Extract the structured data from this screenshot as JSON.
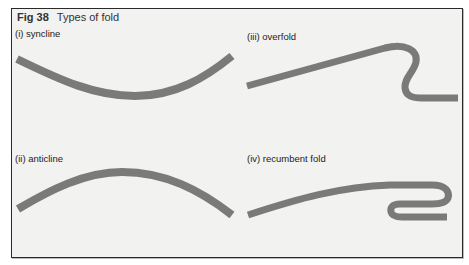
{
  "figure": {
    "number": "Fig 38",
    "title": "Types of fold",
    "stroke_color": "#7a7a7a",
    "background_color": "#f2f2f0",
    "panels": [
      {
        "id": "i",
        "label": "(i) syncline",
        "shape": "U-shaped downward curve"
      },
      {
        "id": "ii",
        "label": "(ii) anticline",
        "shape": "arch-shaped upward curve"
      },
      {
        "id": "iii",
        "label": "(iii) overfold",
        "shape": "rising limb folded over into S-bend"
      },
      {
        "id": "iv",
        "label": "(iv) recumbent fold",
        "shape": "near-horizontal limb folded back on itself"
      }
    ]
  }
}
